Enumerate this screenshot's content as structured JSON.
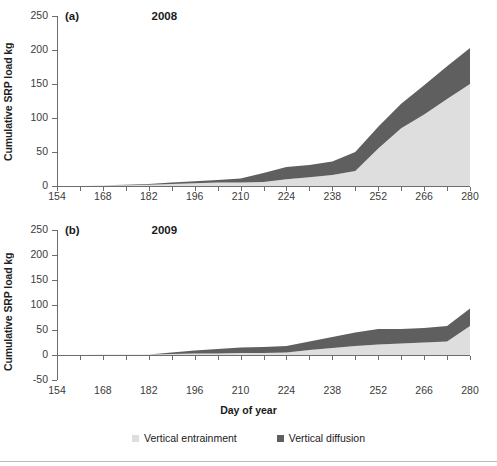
{
  "figure": {
    "ylabel": "Cumulative SRP load kg",
    "xlabel": "Day of year"
  },
  "legend": {
    "items": [
      {
        "label": "Vertical entrainment",
        "color": "#dedede"
      },
      {
        "label": "Vertical diffusion",
        "color": "#5f5f5f"
      }
    ]
  },
  "panel_a": {
    "corner": "(a)",
    "title": "2008",
    "yticks": [
      "250",
      "200",
      "150",
      "100",
      "50",
      "0"
    ],
    "xticks": [
      "154",
      "168",
      "182",
      "196",
      "210",
      "224",
      "238",
      "252",
      "266",
      "280"
    ]
  },
  "panel_b": {
    "corner": "(b)",
    "title": "2009",
    "yticks": [
      "250",
      "200",
      "150",
      "100",
      "50",
      "0",
      "-50"
    ],
    "xticks": [
      "154",
      "168",
      "182",
      "196",
      "210",
      "224",
      "238",
      "252",
      "266",
      "280"
    ]
  },
  "chart_data": [
    {
      "type": "area",
      "panel": "(a)",
      "title": "2008",
      "xlabel": "Day of year",
      "ylabel": "Cumulative SRP load kg",
      "xlim": [
        154,
        280
      ],
      "ylim": [
        0,
        250
      ],
      "ytick_values": [
        0,
        50,
        100,
        150,
        200,
        250
      ],
      "xtick_values": [
        154,
        168,
        182,
        196,
        210,
        224,
        238,
        252,
        266,
        280
      ],
      "grid": false,
      "stacked": true,
      "legend_position": "bottom",
      "x": [
        154,
        161,
        168,
        175,
        182,
        189,
        196,
        203,
        210,
        217,
        224,
        231,
        238,
        245,
        252,
        259,
        266,
        273,
        280
      ],
      "series": [
        {
          "name": "Vertical entrainment",
          "color": "#dedede",
          "values": [
            0,
            0,
            1,
            1,
            2,
            3,
            4,
            5,
            5,
            6,
            10,
            13,
            16,
            22,
            55,
            85,
            105,
            128,
            150
          ]
        },
        {
          "name": "Vertical diffusion",
          "color": "#5f5f5f",
          "values": [
            0,
            0,
            0,
            1,
            1,
            2,
            3,
            4,
            6,
            13,
            18,
            18,
            20,
            28,
            32,
            36,
            43,
            48,
            53
          ]
        }
      ],
      "totals": [
        0,
        0,
        1,
        2,
        3,
        5,
        7,
        9,
        11,
        19,
        28,
        31,
        36,
        50,
        87,
        121,
        148,
        176,
        203
      ]
    },
    {
      "type": "area",
      "panel": "(b)",
      "title": "2009",
      "xlabel": "Day of year",
      "ylabel": "Cumulative SRP load kg",
      "xlim": [
        154,
        280
      ],
      "ylim": [
        -50,
        250
      ],
      "ytick_values": [
        -50,
        0,
        50,
        100,
        150,
        200,
        250
      ],
      "xtick_values": [
        154,
        168,
        182,
        196,
        210,
        224,
        238,
        252,
        266,
        280
      ],
      "grid": false,
      "stacked": true,
      "legend_position": "bottom",
      "x": [
        154,
        161,
        168,
        175,
        182,
        189,
        196,
        203,
        210,
        217,
        224,
        231,
        238,
        245,
        252,
        259,
        266,
        273,
        280
      ],
      "series": [
        {
          "name": "Vertical entrainment",
          "color": "#dedede",
          "values": [
            0,
            0,
            1,
            1,
            1,
            2,
            3,
            3,
            4,
            4,
            5,
            10,
            14,
            18,
            21,
            23,
            25,
            27,
            58
          ]
        },
        {
          "name": "Vertical diffusion",
          "color": "#5f5f5f",
          "values": [
            0,
            0,
            0,
            0,
            0,
            3,
            6,
            9,
            11,
            12,
            13,
            17,
            22,
            27,
            31,
            29,
            29,
            31,
            35
          ]
        }
      ],
      "totals": [
        0,
        0,
        1,
        1,
        1,
        5,
        9,
        12,
        15,
        16,
        18,
        27,
        36,
        45,
        52,
        52,
        54,
        58,
        93
      ]
    }
  ]
}
